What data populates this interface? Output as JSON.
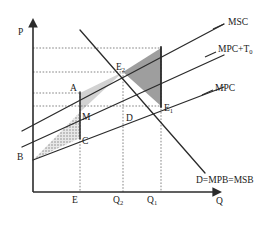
{
  "diagram": {
    "title_type": "negative-externality-pigouvian-tax",
    "axes": {
      "y_label": "P",
      "x_label": "Q"
    },
    "curves": [
      {
        "id": "msc",
        "label": "MSC",
        "label_x": 228,
        "label_y": 22
      },
      {
        "id": "mpct",
        "label": "MPC+T",
        "label_sub": "0",
        "label_x": 218,
        "label_y": 50
      },
      {
        "id": "mpc",
        "label": "MPC",
        "label_x": 215,
        "label_y": 88
      },
      {
        "id": "demand",
        "label": "D=MPB=MSB",
        "label_x": 195,
        "label_y": 180
      }
    ],
    "points": [
      {
        "id": "E2",
        "label": "E",
        "sub": "2",
        "x": 116,
        "y": 67
      },
      {
        "id": "E1",
        "label": "E",
        "sub": "1",
        "x": 163,
        "y": 108
      },
      {
        "id": "A",
        "label": "A",
        "sub": "",
        "x": 70,
        "y": 88
      },
      {
        "id": "M",
        "label": "M",
        "sub": "",
        "x": 73,
        "y": 117
      },
      {
        "id": "C",
        "label": "C",
        "sub": "",
        "x": 73,
        "y": 141
      },
      {
        "id": "D",
        "label": "D",
        "sub": "",
        "x": 118,
        "y": 118
      },
      {
        "id": "B",
        "label": "B",
        "sub": "",
        "x": 17,
        "y": 156
      }
    ],
    "x_ticks": [
      {
        "label": "E",
        "sub": "",
        "x": 72,
        "y": 199
      },
      {
        "label": "Q",
        "sub": "2",
        "x": 114,
        "y": 199
      },
      {
        "label": "Q",
        "sub": "1",
        "x": 147,
        "y": 199
      }
    ],
    "colors": {
      "line": "#2b2b2b",
      "dotted": "#666666",
      "light_shade": "#cfcfcf",
      "dark_shade": "#9a9a9a",
      "hatch_shade": "#b8b8b8",
      "text": "#1a1a1a",
      "background": "#ffffff"
    }
  }
}
